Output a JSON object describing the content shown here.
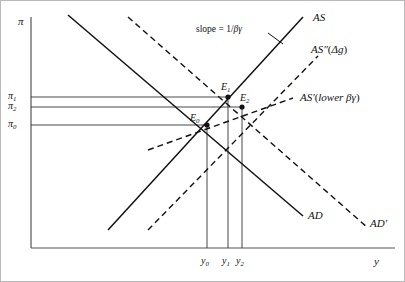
{
  "figure": {
    "type": "economics-ad-as-diagram",
    "background": "#ffffff",
    "line_color": "#111111",
    "frame": {
      "x": 0.5,
      "y": 0.5,
      "width": 404,
      "height": 281,
      "color": "#b9b9b9"
    }
  },
  "axes": {
    "y_axis_label": "π",
    "x_axis_label": "y",
    "origin": {
      "x": 31,
      "y": 248
    },
    "y_axis_top": 17,
    "x_axis_right": 395,
    "axis_color": "#555555"
  },
  "y_ticks": [
    {
      "label": "π",
      "sub": "1",
      "y": 97,
      "line_to_x": 228
    },
    {
      "label": "π",
      "sub": "2",
      "y": 107,
      "line_to_x": 242
    },
    {
      "label": "π",
      "sub": "0",
      "y": 125,
      "line_to_x": 207
    }
  ],
  "x_ticks": [
    {
      "label": "y",
      "sub": "0",
      "x": 207,
      "line_to_y": 125
    },
    {
      "label": "y",
      "sub": "1",
      "x": 228,
      "line_to_y": 97
    },
    {
      "label": "y",
      "sub": "2",
      "x": 242,
      "line_to_y": 107
    }
  ],
  "curves": [
    {
      "name": "AS",
      "style": "solid",
      "label": "AS",
      "label_x": 313,
      "label_y": 12,
      "from": {
        "x": 108,
        "y": 230
      },
      "to": {
        "x": 303,
        "y": 17
      }
    },
    {
      "name": "AD",
      "style": "solid",
      "label": "AD",
      "label_x": 308,
      "label_y": 210,
      "from": {
        "x": 68,
        "y": 15
      },
      "to": {
        "x": 303,
        "y": 216
      }
    },
    {
      "name": "AS-double-prime",
      "style": "dashed",
      "label": "AS″(Δg)",
      "label_x": 311,
      "label_y": 44,
      "from": {
        "x": 148,
        "y": 230
      },
      "to": {
        "x": 318,
        "y": 56
      }
    },
    {
      "name": "AS-prime",
      "style": "dashed",
      "label": "AS′(lower βγ)",
      "label_x": 300,
      "label_y": 92,
      "from": {
        "x": 148,
        "y": 150
      },
      "to": {
        "x": 293,
        "y": 98
      }
    },
    {
      "name": "AD-prime",
      "style": "dashed",
      "label": "AD′",
      "label_x": 370,
      "label_y": 218,
      "from": {
        "x": 128,
        "y": 17
      },
      "to": {
        "x": 368,
        "y": 228
      }
    }
  ],
  "equilibria": [
    {
      "name": "E0",
      "label": "E",
      "sub": "0",
      "x": 207,
      "y": 125,
      "label_x": 190,
      "label_y": 113
    },
    {
      "name": "E1",
      "label": "E",
      "sub": "1",
      "x": 228,
      "y": 97,
      "label_x": 221,
      "label_y": 82
    },
    {
      "name": "E2",
      "label": "E",
      "sub": "2",
      "x": 242,
      "y": 107,
      "label_x": 240,
      "label_y": 93
    }
  ],
  "annotations": [
    {
      "name": "slope-annotation",
      "text_plain": "slope = 1/βγ",
      "text_lead": "slope = 1/",
      "text_italic": "βγ",
      "label_x": 196,
      "label_y": 25,
      "pointer_from": {
        "x": 268,
        "y": 33
      },
      "pointer_to": {
        "x": 283,
        "y": 44
      }
    }
  ]
}
